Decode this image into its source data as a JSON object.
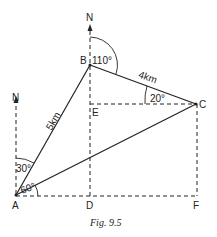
{
  "figure": {
    "caption": "Fig. 9.5",
    "points": {
      "A": "A",
      "B": "B",
      "C": "C",
      "D": "D",
      "E": "E",
      "F": "F"
    },
    "north_labels": {
      "at_A": "N",
      "at_B": "N"
    },
    "distances": {
      "AB": "5km",
      "BC": "4km"
    },
    "angles": {
      "north_A_to_AB": "30°",
      "AB_to_AC": "60°",
      "north_B_to_BC": "110°",
      "EC_to_BC": "20°"
    },
    "colors": {
      "line": "#222222",
      "background": "#ffffff"
    }
  }
}
